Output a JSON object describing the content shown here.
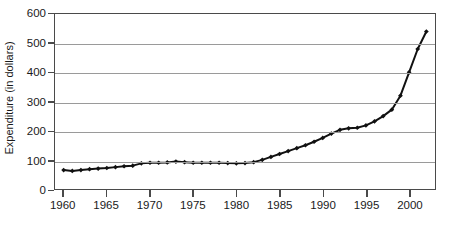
{
  "chart_data": {
    "type": "line",
    "title": "",
    "xlabel": "",
    "ylabel": "Expenditure (in dollars)",
    "xlim": [
      1959,
      2003
    ],
    "ylim": [
      0,
      600
    ],
    "grid": true,
    "legend": null,
    "marker": "diamond",
    "line_color": "#111111",
    "xticks": [
      1960,
      1965,
      1970,
      1975,
      1980,
      1985,
      1990,
      1995,
      2000
    ],
    "yticks": [
      0,
      100,
      200,
      300,
      400,
      500,
      600
    ],
    "x": [
      1960,
      1961,
      1962,
      1963,
      1964,
      1965,
      1966,
      1967,
      1968,
      1969,
      1970,
      1971,
      1972,
      1973,
      1974,
      1975,
      1976,
      1977,
      1978,
      1979,
      1980,
      1981,
      1982,
      1983,
      1984,
      1985,
      1986,
      1987,
      1988,
      1989,
      1990,
      1991,
      1992,
      1993,
      1994,
      1995,
      1996,
      1997,
      1998,
      1999,
      2000,
      2001,
      2002
    ],
    "values": [
      65,
      62,
      65,
      68,
      70,
      72,
      75,
      78,
      80,
      88,
      90,
      90,
      91,
      94,
      92,
      90,
      90,
      90,
      90,
      89,
      88,
      89,
      92,
      100,
      110,
      120,
      130,
      140,
      150,
      162,
      175,
      190,
      203,
      208,
      210,
      218,
      232,
      250,
      272,
      320,
      400,
      480,
      540
    ]
  },
  "caption": {
    "text": ""
  }
}
